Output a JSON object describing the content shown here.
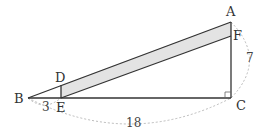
{
  "diagram": {
    "type": "geometry",
    "points": {
      "A": {
        "label": "A",
        "x": 231,
        "y": 22
      },
      "B": {
        "label": "B",
        "x": 28,
        "y": 98
      },
      "C": {
        "label": "C",
        "x": 231,
        "y": 98
      },
      "D": {
        "label": "D",
        "x": 61,
        "y": 85
      },
      "E": {
        "label": "E",
        "x": 61,
        "y": 98
      },
      "F": {
        "label": "F",
        "x": 231,
        "y": 36
      }
    },
    "measurements": {
      "BE": "3",
      "BC": "18",
      "AC": "7"
    },
    "colors": {
      "line": "#333333",
      "shade": "#e3e3e3",
      "dashed": "#aaaaaa"
    }
  }
}
